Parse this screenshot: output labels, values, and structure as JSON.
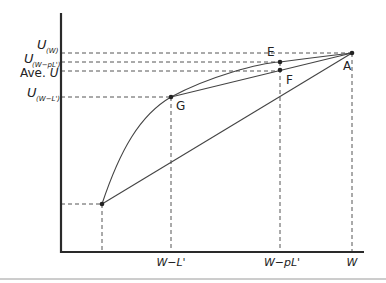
{
  "diagram": {
    "type": "utility-curve",
    "colors": {
      "axis": "#2a2a2a",
      "line": "#444444",
      "dash": "#555555",
      "footer_rule": "#9a9a9a"
    },
    "y_axis_labels": [
      {
        "main": "U",
        "sub": "(W)"
      },
      {
        "main": "U",
        "sub": "(W−pL')"
      },
      {
        "prefix": "Ave. ",
        "main": "U",
        "sub": ""
      },
      {
        "main": "U",
        "sub": "(W−L')"
      }
    ],
    "x_axis_labels": [
      "W−L'",
      "W−pL'",
      "W"
    ],
    "points": {
      "A": {
        "label": "A"
      },
      "E": {
        "label": "E"
      },
      "F": {
        "label": "F"
      },
      "G": {
        "label": "G"
      }
    }
  }
}
